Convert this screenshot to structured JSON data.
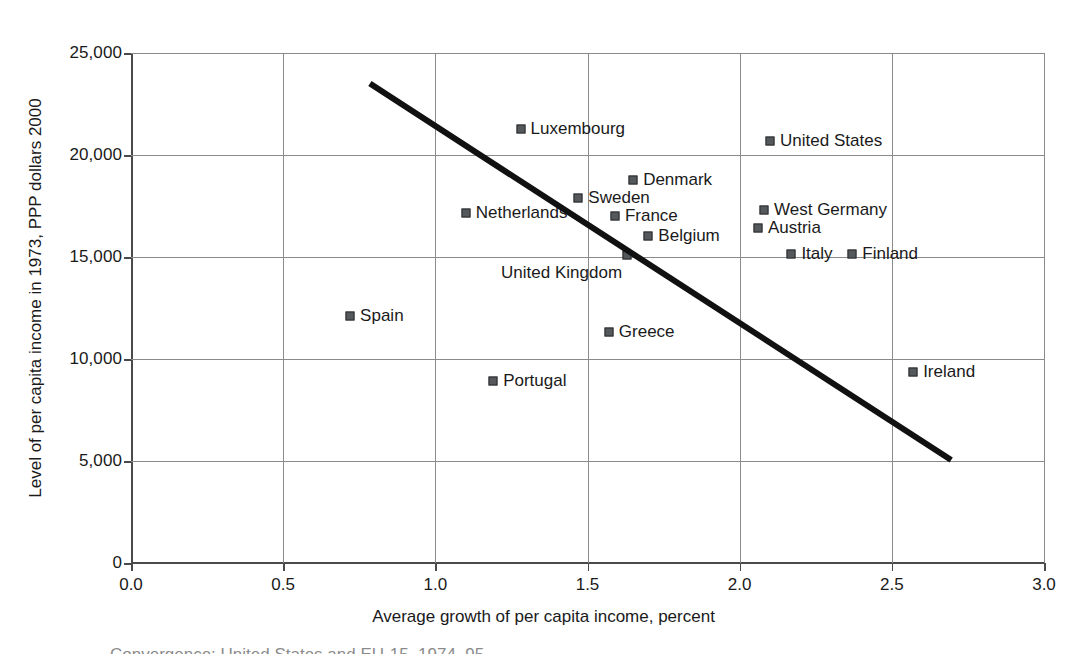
{
  "chart_data": {
    "type": "scatter",
    "title": "",
    "xlabel": "Average growth of per capita income, percent",
    "ylabel": "Level of per capita income in 1973, PPP dollars 2000",
    "xlim": [
      0.0,
      3.0
    ],
    "ylim": [
      0,
      25000
    ],
    "grid": true,
    "legend": "none",
    "xticks": [
      "0.0",
      "0.5",
      "1.0",
      "1.5",
      "2.0",
      "2.5",
      "3.0"
    ],
    "xtick_values": [
      0.0,
      0.5,
      1.0,
      1.5,
      2.0,
      2.5,
      3.0
    ],
    "yticks": [
      "0",
      "5,000",
      "10,000",
      "15,000",
      "20,000",
      "25,000"
    ],
    "ytick_values": [
      0,
      5000,
      10000,
      15000,
      20000,
      25000
    ],
    "points": [
      {
        "label": "Luxembourg",
        "x": 1.28,
        "y": 21270,
        "label_side": "right"
      },
      {
        "label": "United States",
        "x": 2.1,
        "y": 20690,
        "label_side": "right"
      },
      {
        "label": "Denmark",
        "x": 1.65,
        "y": 18770,
        "label_side": "right"
      },
      {
        "label": "Sweden",
        "x": 1.47,
        "y": 17890,
        "label_side": "right"
      },
      {
        "label": "West Germany",
        "x": 2.08,
        "y": 17300,
        "label_side": "right"
      },
      {
        "label": "Netherlands",
        "x": 1.1,
        "y": 17160,
        "label_side": "right"
      },
      {
        "label": "France",
        "x": 1.59,
        "y": 17010,
        "label_side": "right"
      },
      {
        "label": "Austria",
        "x": 2.06,
        "y": 16420,
        "label_side": "right"
      },
      {
        "label": "Belgium",
        "x": 1.7,
        "y": 16030,
        "label_side": "right"
      },
      {
        "label": "Italy",
        "x": 2.17,
        "y": 15150,
        "label_side": "right"
      },
      {
        "label": "Finland",
        "x": 2.37,
        "y": 15150,
        "label_side": "right"
      },
      {
        "label": "United Kingdom",
        "x": 1.63,
        "y": 15100,
        "label_side": "below"
      },
      {
        "label": "Spain",
        "x": 0.72,
        "y": 12110,
        "label_side": "right"
      },
      {
        "label": "Greece",
        "x": 1.57,
        "y": 11320,
        "label_side": "right"
      },
      {
        "label": "Ireland",
        "x": 2.57,
        "y": 9360,
        "label_side": "right"
      },
      {
        "label": "Portugal",
        "x": 1.19,
        "y": 8920,
        "label_side": "right"
      }
    ],
    "trendline": {
      "x0": 0.785,
      "y0": 23500,
      "x1": 2.695,
      "y1": 5050,
      "style": "solid",
      "color": "#111111",
      "width_px": 6
    }
  },
  "caption": {
    "text": "Convergence: United States and EU-15, 1974–95"
  },
  "colors": {
    "marker": "#55595c",
    "marker_edge": "#2b2d2f",
    "grid": "#8a8a8a",
    "axis": "#4a4a4a",
    "text": "#1a1a1a",
    "trend": "#111111"
  }
}
